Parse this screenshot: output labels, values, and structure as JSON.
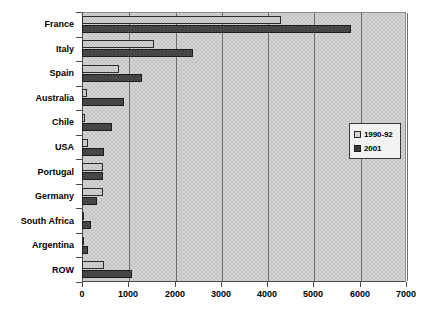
{
  "chart_data": {
    "type": "bar",
    "orientation": "horizontal",
    "title": "",
    "xlabel": "",
    "ylabel": "",
    "xlim": [
      0,
      7000
    ],
    "xticks": [
      "0",
      "1000",
      "2000",
      "3000",
      "4000",
      "5000",
      "6000",
      "7000"
    ],
    "grid": true,
    "legend_position": "right",
    "categories": [
      "France",
      "Italy",
      "Spain",
      "Australia",
      "Chile",
      "USA",
      "Portugal",
      "Germany",
      "South Africa",
      "Argentina",
      "ROW"
    ],
    "series": [
      {
        "name": "1990-92",
        "color": "#d4d4d4",
        "values": [
          4300,
          1550,
          800,
          100,
          60,
          130,
          450,
          450,
          30,
          20,
          480
        ]
      },
      {
        "name": "2001",
        "color": "#3a3a3a",
        "values": [
          5820,
          2400,
          1300,
          900,
          650,
          480,
          450,
          330,
          200,
          140,
          1080
        ]
      }
    ]
  }
}
